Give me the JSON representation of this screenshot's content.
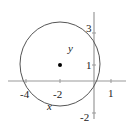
{
  "diagram": {
    "type": "circle-on-axes",
    "circle": {
      "center": [
        -2,
        1
      ],
      "radius_approx": 2.24
    },
    "center_point": {
      "x": -2,
      "y": 1
    },
    "axis_labels": {
      "x": "x",
      "y": "y"
    },
    "x_ticks": [
      "-4",
      "-2",
      "1"
    ],
    "y_ticks": [
      "3",
      "1",
      "-2"
    ],
    "colors": {
      "axis": "#999999",
      "circle": "#555555",
      "text": "#222222",
      "point": "#000000"
    }
  }
}
